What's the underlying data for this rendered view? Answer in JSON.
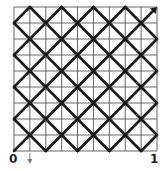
{
  "diagram": {
    "title": "",
    "grid": {
      "columns": 9,
      "rows": 9,
      "left": 14,
      "top": 7,
      "right": 157,
      "bottom": 151,
      "line_color": "#555555",
      "line_width": 0.9
    },
    "lattice": {
      "description": "45-degree diagonal lattice through grid points where column+row index is odd",
      "line_color": "#1a1a1a",
      "line_width": 2.6,
      "step_cells": 2
    },
    "arrow": {
      "from": [
        8,
        1
      ],
      "to": [
        9,
        0
      ],
      "color": "#1a1a1a"
    },
    "marker": {
      "column": 1,
      "direction": "down",
      "color": "#777777"
    },
    "axis_labels": {
      "start": "0",
      "end": "1"
    }
  }
}
